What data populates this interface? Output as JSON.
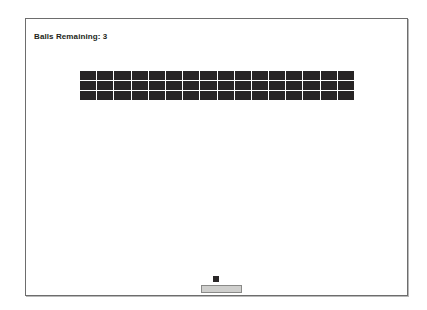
{
  "window": {
    "title": "Brick Breaker Game",
    "border_color": "#6d6d6d",
    "background_color": "#ffffff"
  },
  "hud": {
    "balls_remaining_label": "Balls Remaining: 3",
    "balls_remaining_count": 3,
    "text_color": "#231f20"
  },
  "bricks": {
    "rows": 3,
    "columns": 16,
    "color": "#272425",
    "total": 48,
    "grid": [
      [
        "brick",
        "brick",
        "brick",
        "brick",
        "brick",
        "brick",
        "brick",
        "brick",
        "brick",
        "brick",
        "brick",
        "brick",
        "brick",
        "brick",
        "brick",
        "brick"
      ],
      [
        "brick",
        "brick",
        "brick",
        "brick",
        "brick",
        "brick",
        "brick",
        "brick",
        "brick",
        "brick",
        "brick",
        "brick",
        "brick",
        "brick",
        "brick",
        "brick"
      ],
      [
        "brick",
        "brick",
        "brick",
        "brick",
        "brick",
        "brick",
        "brick",
        "brick",
        "brick",
        "brick",
        "brick",
        "brick",
        "brick",
        "brick",
        "brick",
        "brick"
      ]
    ]
  },
  "ball": {
    "name": "ball",
    "color": "#2a2728",
    "size": 6
  },
  "paddle": {
    "name": "paddle",
    "fill_color": "#d8d8d6",
    "border_color": "#8a8a88",
    "width": 41,
    "height": 8
  }
}
